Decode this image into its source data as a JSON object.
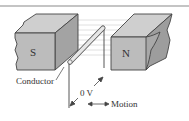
{
  "diagram": {
    "magnets": {
      "south": {
        "label": "S"
      },
      "north": {
        "label": "N"
      }
    },
    "labels": {
      "conductor": "Conductor",
      "voltage": "0 V",
      "motion": "Motion"
    },
    "colors": {
      "magnet_front": "#b9b9b9",
      "magnet_top": "#cfcfcf",
      "magnet_side": "#9a9a9a",
      "field_lines": "#d6d6d6",
      "rod": "#e2e2e2",
      "line": "#444444",
      "rule": "#888888"
    }
  }
}
